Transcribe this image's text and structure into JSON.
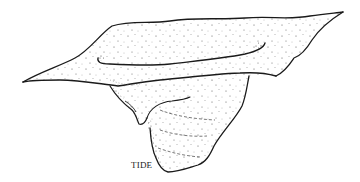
{
  "figure": {
    "type": "stippled line illustration",
    "labels": [
      {
        "text": "TIDE",
        "x": 131,
        "y": 166
      }
    ],
    "colors": {
      "ink": "#1a1a1a",
      "stipple": "#4a4a4a",
      "background": "#ffffff"
    }
  }
}
